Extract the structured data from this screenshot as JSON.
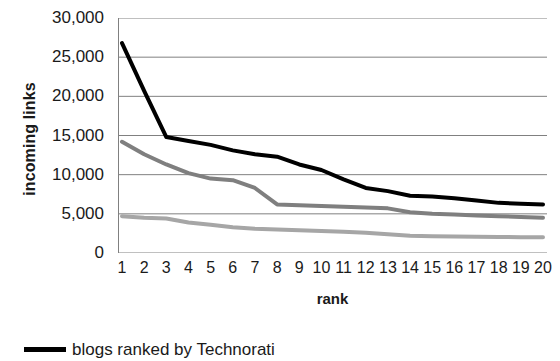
{
  "chart_data": {
    "type": "line",
    "title": "",
    "xlabel": "rank",
    "ylabel": "incoming links",
    "x": [
      1,
      2,
      3,
      4,
      5,
      6,
      7,
      8,
      9,
      10,
      11,
      12,
      13,
      14,
      15,
      16,
      17,
      18,
      19,
      20
    ],
    "categories": [
      "1",
      "2",
      "3",
      "4",
      "5",
      "6",
      "7",
      "8",
      "9",
      "10",
      "11",
      "12",
      "13",
      "14",
      "15",
      "16",
      "17",
      "18",
      "19",
      "20"
    ],
    "ylim": [
      0,
      30000
    ],
    "yticks": [
      30000,
      25000,
      20000,
      15000,
      10000,
      5000,
      0
    ],
    "ytick_labels": [
      "30,000",
      "25,000",
      "20,000",
      "15,000",
      "10,000",
      "5,000",
      "0"
    ],
    "grid": true,
    "grid_axis": "y",
    "legend_position": "bottom-left",
    "series": [
      {
        "name": "blogs ranked by Technorati",
        "color": "#000000",
        "width": 4,
        "values": [
          26800,
          20700,
          14800,
          14300,
          13800,
          13100,
          12600,
          12300,
          11300,
          10600,
          9400,
          8300,
          7900,
          7300,
          7200,
          7000,
          6700,
          6400,
          6300,
          6200
        ]
      },
      {
        "name": "series-2",
        "color": "#7f7f7f",
        "width": 4,
        "values": [
          14200,
          12600,
          11300,
          10200,
          9500,
          9300,
          8300,
          6200,
          6100,
          6000,
          5900,
          5800,
          5700,
          5200,
          5000,
          4900,
          4800,
          4700,
          4600,
          4500
        ]
      },
      {
        "name": "series-3",
        "color": "#a6a6a6",
        "width": 4,
        "values": [
          4700,
          4500,
          4400,
          3900,
          3600,
          3300,
          3100,
          3000,
          2900,
          2800,
          2700,
          2600,
          2400,
          2200,
          2150,
          2100,
          2080,
          2050,
          2020,
          2000
        ]
      }
    ],
    "legend": [
      {
        "label": "blogs ranked by Technorati",
        "color": "#000000"
      }
    ],
    "axis_color": "#808080",
    "grid_color": "#808080"
  }
}
